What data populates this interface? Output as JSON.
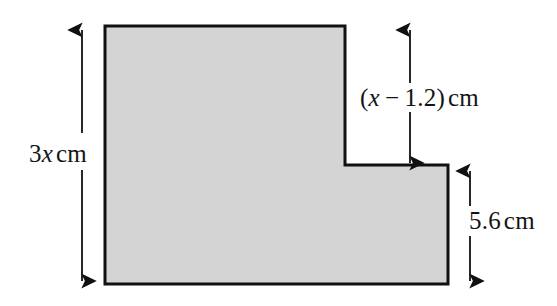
{
  "figure": {
    "background_color": "#ffffff",
    "fill_color": "#d4d4d4",
    "stroke_color": "#111111",
    "stroke_width": 3,
    "shape_name": "l-shaped-polygon",
    "vertices": [
      [
        105,
        26
      ],
      [
        345,
        26
      ],
      [
        345,
        165
      ],
      [
        448,
        165
      ],
      [
        448,
        284
      ],
      [
        105,
        284
      ]
    ]
  },
  "dimensions": {
    "total_height": {
      "name": "total-height-dimension",
      "coefficient": "3",
      "variable": "x",
      "unit": "cm",
      "full_text": "3x cm",
      "arrow": {
        "x": 82,
        "y_top": 26,
        "y_bottom": 285,
        "gap_top": 130,
        "gap_bottom": 172
      }
    },
    "upper_segment": {
      "name": "upper-segment-dimension",
      "expression_open": "(",
      "variable": "x",
      "operator": "−",
      "value": "1.2",
      "expression_close": ")",
      "unit": "cm",
      "full_text": "(x − 1.2) cm",
      "arrow": {
        "x": 410,
        "y_top": 26,
        "y_bottom": 167,
        "gap_top": 83,
        "gap_bottom": 114
      }
    },
    "lower_segment": {
      "name": "lower-segment-dimension",
      "value": "5.6",
      "unit": "cm",
      "full_text": "5.6 cm",
      "arrow": {
        "x": 470,
        "y_top": 167,
        "y_bottom": 285,
        "gap_top": 205,
        "gap_bottom": 238
      }
    }
  }
}
